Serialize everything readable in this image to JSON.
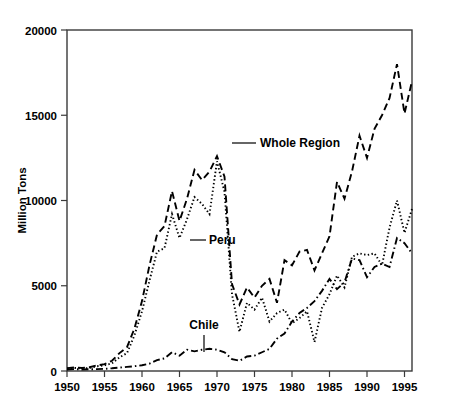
{
  "chart_data": {
    "type": "line",
    "title": "",
    "xlabel": "",
    "ylabel": "Million Tons",
    "xlim": [
      1950,
      1996
    ],
    "ylim": [
      0,
      20000
    ],
    "grid": false,
    "legend_position": "inline-annotations",
    "x_ticks": [
      1950,
      1955,
      1960,
      1965,
      1970,
      1975,
      1980,
      1985,
      1990,
      1995
    ],
    "y_ticks": [
      0,
      5000,
      10000,
      15000,
      20000
    ],
    "x": [
      1950,
      1951,
      1952,
      1953,
      1954,
      1955,
      1956,
      1957,
      1958,
      1959,
      1960,
      1961,
      1962,
      1963,
      1964,
      1965,
      1966,
      1967,
      1968,
      1969,
      1970,
      1971,
      1972,
      1973,
      1974,
      1975,
      1976,
      1977,
      1978,
      1979,
      1980,
      1981,
      1982,
      1983,
      1984,
      1985,
      1986,
      1987,
      1988,
      1989,
      1990,
      1991,
      1992,
      1993,
      1994,
      1995,
      1996
    ],
    "series": [
      {
        "name": "Whole Region",
        "style": "dashed",
        "values": [
          170,
          210,
          180,
          220,
          330,
          400,
          600,
          1050,
          1400,
          2500,
          4100,
          6200,
          8000,
          8500,
          10550,
          8800,
          10100,
          11800,
          11200,
          11700,
          12600,
          11400,
          5100,
          3900,
          4900,
          4300,
          5000,
          5400,
          4000,
          6500,
          6200,
          7000,
          7100,
          5900,
          6900,
          7900,
          11100,
          10100,
          11700,
          13800,
          12500,
          14200,
          15000,
          16000,
          18000,
          15100,
          17000
        ]
      },
      {
        "name": "Peru",
        "style": "dotted",
        "values": [
          140,
          180,
          150,
          180,
          280,
          330,
          450,
          800,
          1050,
          2100,
          3500,
          5300,
          7000,
          7200,
          9200,
          7800,
          8900,
          10200,
          9800,
          9200,
          12300,
          10500,
          4500,
          2300,
          4000,
          3600,
          4300,
          2900,
          3400,
          3600,
          2800,
          3100,
          3500,
          1700,
          3700,
          4500,
          5600,
          4900,
          6700,
          6900,
          6800,
          6900,
          6200,
          8400,
          10000,
          8100,
          9500
        ]
      },
      {
        "name": "Chile",
        "style": "dashdot",
        "values": [
          90,
          110,
          90,
          100,
          110,
          130,
          160,
          200,
          240,
          280,
          340,
          430,
          640,
          740,
          1100,
          900,
          1250,
          1150,
          1250,
          1300,
          1250,
          1100,
          700,
          600,
          850,
          900,
          1100,
          1300,
          1900,
          2200,
          2900,
          3400,
          3700,
          4100,
          4700,
          5400,
          4800,
          5200,
          6600,
          6500,
          5500,
          6100,
          6300,
          6100,
          7800,
          7500,
          6900
        ]
      }
    ],
    "annotations": [
      {
        "name": "whole-region",
        "text": "Whole Region"
      },
      {
        "name": "peru",
        "text": "Peru"
      },
      {
        "name": "chile",
        "text": "Chile"
      }
    ]
  }
}
